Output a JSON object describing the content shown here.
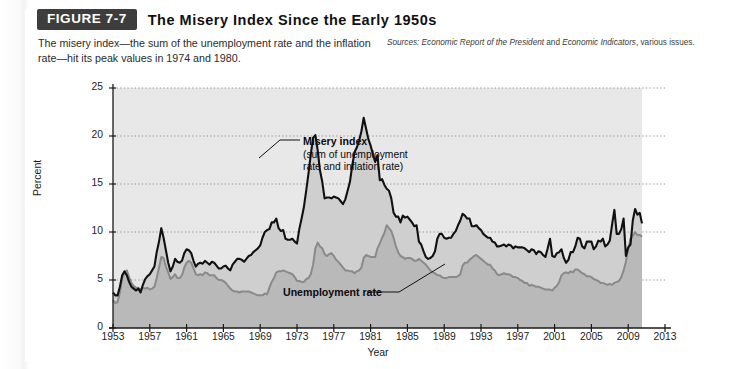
{
  "figure": {
    "tag": "FIGURE 7-7",
    "title": "The Misery Index Since the Early 1950s",
    "caption": "The misery index—the sum of the unemployment rate and the inflation rate—hit its peak values in 1974 and 1980.",
    "sources_prefix": "Sources:",
    "sources_italic_1": "Economic Report of the President",
    "sources_mid": " and ",
    "sources_italic_2": "Economic Indicators",
    "sources_suffix": ", various issues."
  },
  "annotations": {
    "misery_title": "Misery index",
    "misery_sub_line1": "(sum of unemployment",
    "misery_sub_line2": "rate and inflation rate)",
    "unemployment": "Unemployment rate"
  },
  "colors": {
    "misery_line": "#111111",
    "unemployment_line": "#8a8a8a",
    "area_fill": "#b9b9b9",
    "plot_background": "#ffffff",
    "panel_background": "#ffffff",
    "header_bar": "#3d3d3d",
    "grid": "#9a9a9a"
  },
  "chart_data": {
    "type": "area",
    "title": "The Misery Index Since the Early 1950s",
    "xlabel": "Year",
    "ylabel": "Percent",
    "xlim": [
      1953,
      2013
    ],
    "ylim": [
      0,
      25
    ],
    "yticks": [
      0,
      5,
      10,
      15,
      20,
      25
    ],
    "xticks": [
      1953,
      1957,
      1961,
      1965,
      1969,
      1973,
      1977,
      1981,
      1985,
      1989,
      1993,
      1997,
      2001,
      2005,
      2009,
      2013
    ],
    "grid": "horizontal-dotted",
    "legend": "inline-annotations",
    "data_end_year": 2010.5,
    "peaks": [
      {
        "year": 1974,
        "series": "Misery index",
        "value": 20.1
      },
      {
        "year": 1980,
        "series": "Misery index",
        "value": 21.9
      }
    ],
    "x": [
      1953.0,
      1953.25,
      1953.5,
      1953.75,
      1954.0,
      1954.25,
      1954.5,
      1954.75,
      1955.0,
      1955.25,
      1955.5,
      1955.75,
      1956.0,
      1956.25,
      1956.5,
      1956.75,
      1957.0,
      1957.25,
      1957.5,
      1957.75,
      1958.0,
      1958.25,
      1958.5,
      1958.75,
      1959.0,
      1959.25,
      1959.5,
      1959.75,
      1960.0,
      1960.25,
      1960.5,
      1960.75,
      1961.0,
      1961.25,
      1961.5,
      1961.75,
      1962.0,
      1962.25,
      1962.5,
      1962.75,
      1963.0,
      1963.25,
      1963.5,
      1963.75,
      1964.0,
      1964.25,
      1964.5,
      1964.75,
      1965.0,
      1965.25,
      1965.5,
      1965.75,
      1966.0,
      1966.25,
      1966.5,
      1966.75,
      1967.0,
      1967.25,
      1967.5,
      1967.75,
      1968.0,
      1968.25,
      1968.5,
      1968.75,
      1969.0,
      1969.25,
      1969.5,
      1969.75,
      1970.0,
      1970.25,
      1970.5,
      1970.75,
      1971.0,
      1971.25,
      1971.5,
      1971.75,
      1972.0,
      1972.25,
      1972.5,
      1972.75,
      1973.0,
      1973.25,
      1973.5,
      1973.75,
      1974.0,
      1974.25,
      1974.5,
      1974.75,
      1975.0,
      1975.25,
      1975.5,
      1975.75,
      1976.0,
      1976.25,
      1976.5,
      1976.75,
      1977.0,
      1977.25,
      1977.5,
      1977.75,
      1978.0,
      1978.25,
      1978.5,
      1978.75,
      1979.0,
      1979.25,
      1979.5,
      1979.75,
      1980.0,
      1980.25,
      1980.5,
      1980.75,
      1981.0,
      1981.25,
      1981.5,
      1981.75,
      1982.0,
      1982.25,
      1982.5,
      1982.75,
      1983.0,
      1983.25,
      1983.5,
      1983.75,
      1984.0,
      1984.25,
      1984.5,
      1984.75,
      1985.0,
      1985.25,
      1985.5,
      1985.75,
      1986.0,
      1986.25,
      1986.5,
      1986.75,
      1987.0,
      1987.25,
      1987.5,
      1987.75,
      1988.0,
      1988.25,
      1988.5,
      1988.75,
      1989.0,
      1989.25,
      1989.5,
      1989.75,
      1990.0,
      1990.25,
      1990.5,
      1990.75,
      1991.0,
      1991.25,
      1991.5,
      1991.75,
      1992.0,
      1992.25,
      1992.5,
      1992.75,
      1993.0,
      1993.25,
      1993.5,
      1993.75,
      1994.0,
      1994.25,
      1994.5,
      1994.75,
      1995.0,
      1995.25,
      1995.5,
      1995.75,
      1996.0,
      1996.25,
      1996.5,
      1996.75,
      1997.0,
      1997.25,
      1997.5,
      1997.75,
      1998.0,
      1998.25,
      1998.5,
      1998.75,
      1999.0,
      1999.25,
      1999.5,
      1999.75,
      2000.0,
      2000.25,
      2000.5,
      2000.75,
      2001.0,
      2001.25,
      2001.5,
      2001.75,
      2002.0,
      2002.25,
      2002.5,
      2002.75,
      2003.0,
      2003.25,
      2003.5,
      2003.75,
      2004.0,
      2004.25,
      2004.5,
      2004.75,
      2005.0,
      2005.25,
      2005.5,
      2005.75,
      2006.0,
      2006.25,
      2006.5,
      2006.75,
      2007.0,
      2007.25,
      2007.5,
      2007.75,
      2008.0,
      2008.25,
      2008.5,
      2008.75,
      2009.0,
      2009.25,
      2009.5,
      2009.75,
      2010.0,
      2010.25,
      2010.5
    ],
    "series": [
      {
        "name": "Unemployment rate",
        "color": "#8a8a8a",
        "values": [
          2.9,
          2.6,
          2.7,
          3.7,
          5.2,
          5.8,
          6.0,
          5.3,
          4.7,
          4.4,
          4.2,
          4.2,
          4.0,
          4.2,
          4.1,
          4.2,
          4.0,
          4.1,
          4.3,
          5.2,
          6.3,
          7.4,
          7.3,
          6.4,
          5.8,
          5.1,
          5.3,
          5.6,
          5.2,
          5.2,
          5.5,
          6.3,
          6.8,
          7.0,
          6.8,
          6.2,
          5.6,
          5.5,
          5.6,
          5.5,
          5.8,
          5.7,
          5.5,
          5.5,
          5.5,
          5.2,
          5.0,
          5.0,
          4.9,
          4.7,
          4.4,
          4.1,
          3.9,
          3.8,
          3.8,
          3.7,
          3.8,
          3.8,
          3.8,
          3.8,
          3.7,
          3.6,
          3.5,
          3.4,
          3.4,
          3.4,
          3.6,
          3.5,
          4.2,
          4.8,
          5.2,
          5.8,
          5.9,
          5.9,
          6.0,
          5.9,
          5.8,
          5.7,
          5.6,
          5.3,
          4.9,
          4.9,
          4.8,
          4.8,
          5.1,
          5.2,
          5.6,
          6.6,
          8.3,
          8.9,
          8.5,
          8.3,
          7.7,
          7.5,
          7.7,
          7.8,
          7.5,
          7.1,
          6.9,
          6.6,
          6.3,
          6.0,
          6.0,
          5.9,
          5.9,
          5.7,
          5.9,
          6.0,
          6.3,
          7.3,
          7.6,
          7.5,
          7.4,
          7.4,
          7.4,
          8.3,
          8.8,
          9.4,
          9.9,
          10.7,
          10.4,
          10.1,
          9.4,
          8.5,
          7.9,
          7.5,
          7.4,
          7.2,
          7.3,
          7.3,
          7.2,
          7.0,
          7.0,
          7.2,
          7.0,
          6.8,
          6.6,
          6.3,
          6.0,
          5.8,
          5.7,
          5.5,
          5.5,
          5.3,
          5.2,
          5.2,
          5.3,
          5.3,
          5.3,
          5.3,
          5.4,
          5.6,
          6.5,
          6.8,
          6.8,
          7.1,
          7.3,
          7.5,
          7.6,
          7.4,
          7.2,
          7.0,
          6.8,
          6.6,
          6.6,
          6.2,
          6.0,
          5.6,
          5.5,
          5.6,
          5.7,
          5.6,
          5.6,
          5.5,
          5.3,
          5.3,
          5.2,
          5.0,
          4.9,
          4.7,
          4.7,
          4.4,
          4.5,
          4.4,
          4.3,
          4.3,
          4.2,
          4.1,
          4.0,
          4.0,
          4.0,
          3.9,
          4.2,
          4.4,
          4.8,
          5.5,
          5.7,
          5.8,
          5.7,
          5.9,
          5.8,
          6.1,
          6.1,
          5.9,
          5.7,
          5.6,
          5.4,
          5.4,
          5.3,
          5.1,
          5.0,
          4.9,
          4.7,
          4.7,
          4.6,
          4.5,
          4.6,
          4.5,
          4.7,
          4.8,
          4.9,
          5.3,
          6.0,
          6.9,
          8.2,
          9.3,
          9.6,
          10.0,
          9.7,
          9.7,
          9.5
        ]
      },
      {
        "name": "Misery index",
        "color": "#111111",
        "values": [
          3.7,
          3.4,
          3.4,
          4.3,
          5.5,
          5.9,
          5.5,
          4.8,
          4.3,
          4.1,
          3.9,
          4.1,
          3.7,
          4.5,
          5.1,
          5.4,
          5.6,
          6.0,
          6.4,
          7.9,
          9.0,
          10.4,
          9.4,
          8.1,
          6.8,
          5.9,
          6.4,
          7.2,
          6.9,
          6.8,
          7.0,
          7.8,
          8.2,
          8.1,
          7.8,
          7.0,
          6.4,
          6.7,
          6.8,
          6.7,
          7.0,
          6.8,
          6.6,
          6.9,
          6.8,
          6.5,
          6.2,
          6.2,
          6.4,
          6.5,
          6.2,
          6.0,
          6.6,
          6.9,
          7.2,
          7.2,
          7.1,
          6.9,
          7.2,
          7.5,
          7.6,
          7.9,
          8.1,
          8.3,
          8.6,
          9.4,
          10.0,
          10.2,
          10.3,
          11.0,
          11.0,
          11.4,
          10.4,
          10.1,
          10.2,
          9.3,
          9.2,
          9.2,
          9.3,
          9.0,
          8.8,
          10.3,
          11.4,
          12.6,
          14.3,
          16.1,
          18.1,
          19.8,
          20.1,
          18.5,
          16.4,
          15.2,
          13.5,
          13.6,
          13.6,
          13.5,
          13.7,
          13.6,
          13.5,
          13.2,
          12.9,
          13.4,
          14.3,
          15.2,
          16.9,
          18.3,
          18.8,
          19.5,
          20.5,
          21.9,
          20.8,
          19.7,
          19.0,
          18.1,
          17.3,
          18.0,
          15.4,
          15.5,
          14.9,
          14.5,
          14.3,
          13.5,
          12.0,
          11.6,
          11.6,
          11.0,
          11.7,
          11.5,
          11.6,
          11.3,
          11.0,
          10.6,
          10.7,
          9.0,
          8.7,
          8.0,
          7.4,
          7.2,
          7.3,
          7.5,
          8.0,
          9.3,
          9.8,
          9.8,
          9.4,
          9.3,
          9.4,
          9.4,
          9.8,
          10.1,
          10.7,
          11.2,
          11.9,
          11.7,
          11.4,
          11.4,
          10.6,
          10.6,
          10.7,
          10.4,
          10.2,
          9.8,
          9.6,
          9.4,
          9.4,
          9.0,
          8.9,
          8.5,
          8.5,
          8.6,
          8.7,
          8.5,
          8.7,
          8.6,
          8.3,
          8.5,
          8.4,
          8.4,
          8.4,
          8.3,
          8.1,
          7.9,
          8.2,
          8.1,
          7.7,
          8.0,
          7.9,
          7.6,
          7.4,
          8.3,
          9.3,
          7.5,
          7.4,
          7.8,
          7.9,
          8.2,
          7.3,
          6.8,
          7.1,
          7.9,
          7.9,
          8.5,
          9.4,
          9.3,
          8.5,
          8.3,
          9.0,
          9.0,
          9.0,
          8.2,
          8.5,
          9.1,
          9.0,
          9.3,
          8.5,
          8.7,
          9.1,
          10.8,
          12.3,
          9.8,
          9.8,
          10.3,
          11.4,
          7.5,
          8.4,
          8.7,
          11.2,
          12.4,
          11.8,
          12.0,
          10.9
        ]
      }
    ]
  }
}
